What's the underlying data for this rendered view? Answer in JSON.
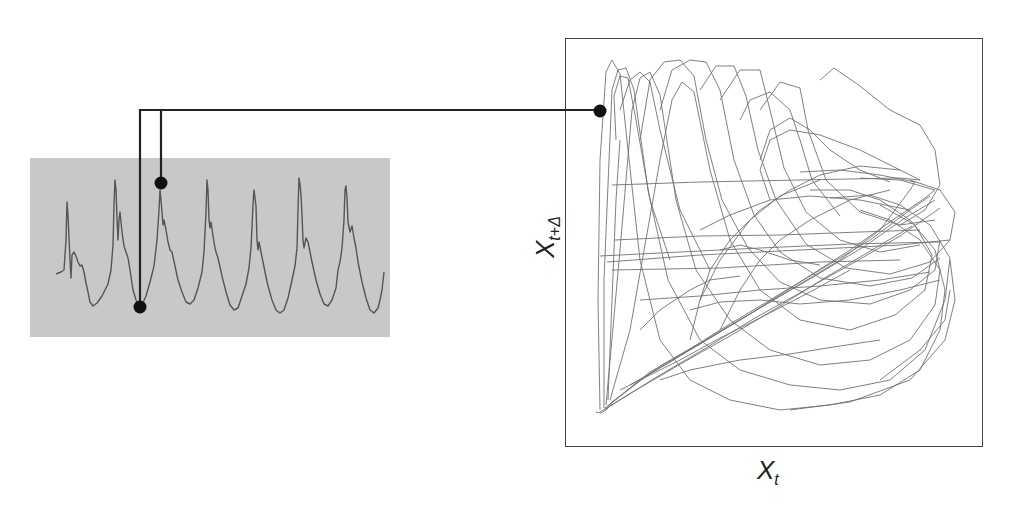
{
  "figure": {
    "time_series_panel": {
      "background": "#c8c8c8",
      "line_color": "#555555",
      "peaks_count": 7,
      "markers": [
        {
          "name": "x_t",
          "position": "trough before 3rd peak"
        },
        {
          "name": "x_t+delta",
          "position": "top of 3rd peak"
        }
      ]
    },
    "phase_space_panel": {
      "x_axis_label": "X",
      "x_axis_subscript": "t",
      "y_axis_label": "X",
      "y_axis_subscript": "t+Δ",
      "line_color": "#555555",
      "marker": "embedded point"
    },
    "connector_color": "#222222"
  }
}
